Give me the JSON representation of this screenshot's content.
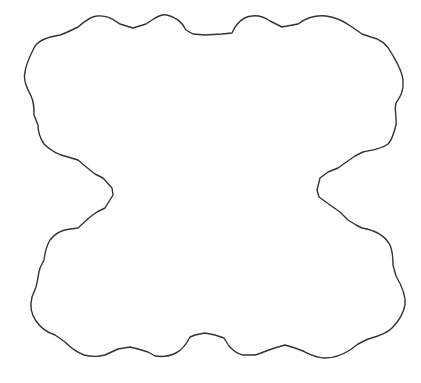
{
  "figure": {
    "description": "Fractal cloud-like closed outline shaped like a bowtie",
    "stroke_color": "#333333",
    "fill_color": "#ffffff",
    "background_color": "#ffffff",
    "stroke_width": 1.4
  },
  "shape": {
    "path": "M 33 50 C 36 42 44 38 55 36 L 60 35 C 66 33 72 30 78 27 C 86 20 92 16 97 16 C 108 15 114 20 120 24 L 133 28 L 146 24 L 152 20 C 158 16 163 14 167 15 C 176 17 182 22 186 30 L 193 34 L 205 35 L 222 34 L 232 33 C 236 24 242 17 252 16 C 259 15 264 17 270 21 L 282 27 L 298 24 C 306 18 316 15 326 16 C 336 17 345 22 352 27 L 362 34 L 371 37 C 382 39 388 46 392 54 C 397 63 402 70 403 80 C 404 92 400 97 396 103 C 394 110 397 118 396 125 C 394 133 392 140 388 144 C 380 150 370 150 363 152 L 355 156 L 345 163 L 338 168 L 328 172 L 320 178 L 317 190 L 319 197 L 330 205 L 340 212 L 348 220 L 356 225 L 362 228 C 374 230 384 234 390 245 C 393 252 393 258 393 265 L 396 276 C 402 286 406 296 405 305 C 403 315 398 322 392 328 C 385 335 375 337 368 339 L 358 344 L 350 350 C 342 355 333 358 325 358 C 316 358 309 354 303 351 L 295 348 L 285 345 L 278 347 C 270 349 262 353 255 355 L 243 355 C 236 354 233 350 229 346 L 224 338 L 215 335 L 205 333 L 195 335 L 190 337 C 186 345 182 350 176 353 C 170 356 162 357 155 356 L 148 352 L 138 349 L 130 347 L 118 349 L 105 355 C 98 357 92 357 84 355 C 76 352 70 347 65 342 L 58 337 L 55 335 C 46 332 40 327 36 321 C 31 314 30 305 32 297 L 36 287 C 38 280 38 274 40 268 L 44 260 C 45 252 47 245 50 240 C 55 233 62 230 70 229 L 78 228 L 90 217 L 97 212 L 105 208 L 113 195 L 112 188 L 103 178 L 95 174 L 85 166 L 78 160 L 68 157 C 58 155 50 150 44 144 C 40 138 38 132 38 125 L 34 115 C 34 107 34 102 31 96 C 27 88 23 80 25 72 C 26 64 30 56 33 50 Z"
  }
}
